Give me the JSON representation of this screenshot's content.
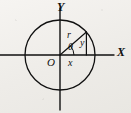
{
  "figure": {
    "name": "polar-coordinate-circle-diagram",
    "background_color": "#f0eeea",
    "ink_color": "#111111"
  },
  "axes": {
    "x_label": "X",
    "y_label": "Y",
    "origin_label": "O"
  },
  "labels": {
    "radius": "r",
    "angle": "θ",
    "vertical_leg": "y",
    "horizontal_leg": "x"
  },
  "geometry": {
    "center_x": 60,
    "center_y": 55,
    "radius_px": 35,
    "point_x": 86,
    "point_y": 32,
    "angle_degrees": 41,
    "x_axis_y": 55,
    "y_axis_x": 60,
    "x_axis_start": 0,
    "x_axis_end": 115,
    "y_axis_start": 8,
    "y_axis_end": 110
  }
}
